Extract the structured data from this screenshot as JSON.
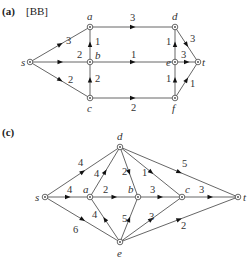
{
  "diagrams": [
    {
      "id": "a",
      "panel_label": "(a)",
      "reference": "[BB]",
      "nodes": [
        {
          "id": "s",
          "label": "s",
          "x": 30,
          "y": 62,
          "lx": 21,
          "ly": 66
        },
        {
          "id": "a",
          "label": "a",
          "x": 90,
          "y": 27,
          "lx": 87,
          "ly": 20
        },
        {
          "id": "b",
          "label": "b",
          "x": 90,
          "y": 62,
          "lx": 95,
          "ly": 59
        },
        {
          "id": "c",
          "label": "c",
          "x": 90,
          "y": 98,
          "lx": 87,
          "ly": 112
        },
        {
          "id": "d",
          "label": "d",
          "x": 175,
          "y": 27,
          "lx": 172,
          "ly": 20
        },
        {
          "id": "e",
          "label": "e",
          "x": 175,
          "y": 62,
          "lx": 166,
          "ly": 66
        },
        {
          "id": "f",
          "label": "f",
          "x": 175,
          "y": 98,
          "lx": 172,
          "ly": 112
        },
        {
          "id": "t",
          "label": "t",
          "x": 198,
          "y": 62,
          "lx": 202,
          "ly": 66
        }
      ],
      "edges": [
        {
          "from": "s",
          "to": "a",
          "capacity": "3",
          "lx": 66,
          "ly": 44
        },
        {
          "from": "s",
          "to": "b",
          "capacity": "2",
          "lx": 77,
          "ly": 58
        },
        {
          "from": "s",
          "to": "c",
          "capacity": "2",
          "lx": 68,
          "ly": 83
        },
        {
          "from": "b",
          "to": "a",
          "capacity": "1",
          "lx": 95,
          "ly": 45
        },
        {
          "from": "c",
          "to": "b",
          "capacity": "2",
          "lx": 95,
          "ly": 82
        },
        {
          "from": "a",
          "to": "d",
          "capacity": "3",
          "lx": 130,
          "ly": 21
        },
        {
          "from": "b",
          "to": "e",
          "capacity": "1",
          "lx": 131,
          "ly": 58
        },
        {
          "from": "c",
          "to": "f",
          "capacity": "2",
          "lx": 131,
          "ly": 111
        },
        {
          "from": "e",
          "to": "d",
          "capacity": "1",
          "lx": 166,
          "ly": 45
        },
        {
          "from": "f",
          "to": "e",
          "capacity": "1",
          "lx": 166,
          "ly": 82
        },
        {
          "from": "d",
          "to": "t",
          "capacity": "3",
          "lx": 190,
          "ly": 42
        },
        {
          "from": "e",
          "to": "t",
          "capacity": "3",
          "lx": 181,
          "ly": 58
        },
        {
          "from": "f",
          "to": "t",
          "capacity": "1",
          "lx": 190,
          "ly": 87
        }
      ]
    },
    {
      "id": "c",
      "panel_label": "(c)",
      "reference": "",
      "nodes": [
        {
          "id": "s",
          "label": "s",
          "x": 45,
          "y": 197,
          "lx": 35,
          "ly": 201
        },
        {
          "id": "a",
          "label": "a",
          "x": 90,
          "y": 197,
          "lx": 83,
          "ly": 193
        },
        {
          "id": "d",
          "label": "d",
          "x": 120,
          "y": 147,
          "lx": 117,
          "ly": 140
        },
        {
          "id": "b",
          "label": "b",
          "x": 138,
          "y": 197,
          "lx": 128,
          "ly": 193
        },
        {
          "id": "c",
          "label": "c",
          "x": 182,
          "y": 197,
          "lx": 185,
          "ly": 193
        },
        {
          "id": "e",
          "label": "e",
          "x": 120,
          "y": 242,
          "lx": 117,
          "ly": 257
        },
        {
          "id": "t",
          "label": "t",
          "x": 238,
          "y": 197,
          "lx": 243,
          "ly": 201
        }
      ],
      "edges": [
        {
          "from": "s",
          "to": "d",
          "capacity": "4",
          "lx": 78,
          "ly": 166
        },
        {
          "from": "s",
          "to": "a",
          "capacity": "4",
          "lx": 67,
          "ly": 193
        },
        {
          "from": "s",
          "to": "e",
          "capacity": "6",
          "lx": 73,
          "ly": 233
        },
        {
          "from": "a",
          "to": "d",
          "capacity": "4",
          "lx": 94,
          "ly": 177
        },
        {
          "from": "a",
          "to": "b",
          "capacity": "2",
          "lx": 103,
          "ly": 193
        },
        {
          "from": "e",
          "to": "a",
          "capacity": "4",
          "lx": 92,
          "ly": 218
        },
        {
          "from": "d",
          "to": "b",
          "capacity": "2",
          "lx": 122,
          "ly": 175
        },
        {
          "from": "d",
          "to": "c",
          "capacity": "1",
          "lx": 142,
          "ly": 176
        },
        {
          "from": "d",
          "to": "t",
          "capacity": "5",
          "lx": 182,
          "ly": 167
        },
        {
          "from": "b",
          "to": "c",
          "capacity": "3",
          "lx": 150,
          "ly": 193
        },
        {
          "from": "e",
          "to": "b",
          "capacity": "5",
          "lx": 122,
          "ly": 222
        },
        {
          "from": "c",
          "to": "t",
          "capacity": "3",
          "lx": 199,
          "ly": 193
        },
        {
          "from": "e",
          "to": "c",
          "capacity": "3",
          "lx": 149,
          "ly": 220
        },
        {
          "from": "e",
          "to": "t",
          "capacity": "2",
          "lx": 181,
          "ly": 229
        }
      ]
    }
  ]
}
